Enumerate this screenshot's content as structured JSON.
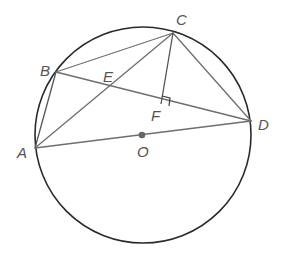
{
  "diagram": {
    "type": "circle-geometry",
    "circle": {
      "center_label": "O",
      "cx": 143,
      "cy": 135,
      "r": 108
    },
    "points": {
      "A": {
        "label": "A",
        "x": 35,
        "y": 148
      },
      "B": {
        "label": "B",
        "x": 56,
        "y": 72
      },
      "C": {
        "label": "C",
        "x": 173,
        "y": 33
      },
      "D": {
        "label": "D",
        "x": 251,
        "y": 121
      },
      "E": {
        "label": "E",
        "x": 109,
        "y": 88
      },
      "F": {
        "label": "F",
        "x": 161,
        "y": 104
      },
      "O": {
        "label": "O",
        "x": 143,
        "y": 135
      }
    },
    "segments": [
      "AB",
      "BC",
      "CA",
      "BD",
      "CD",
      "AD",
      "CF"
    ],
    "annotations": {
      "right_angle_at": "F",
      "diameter": "AD",
      "center_marked": "O"
    }
  }
}
